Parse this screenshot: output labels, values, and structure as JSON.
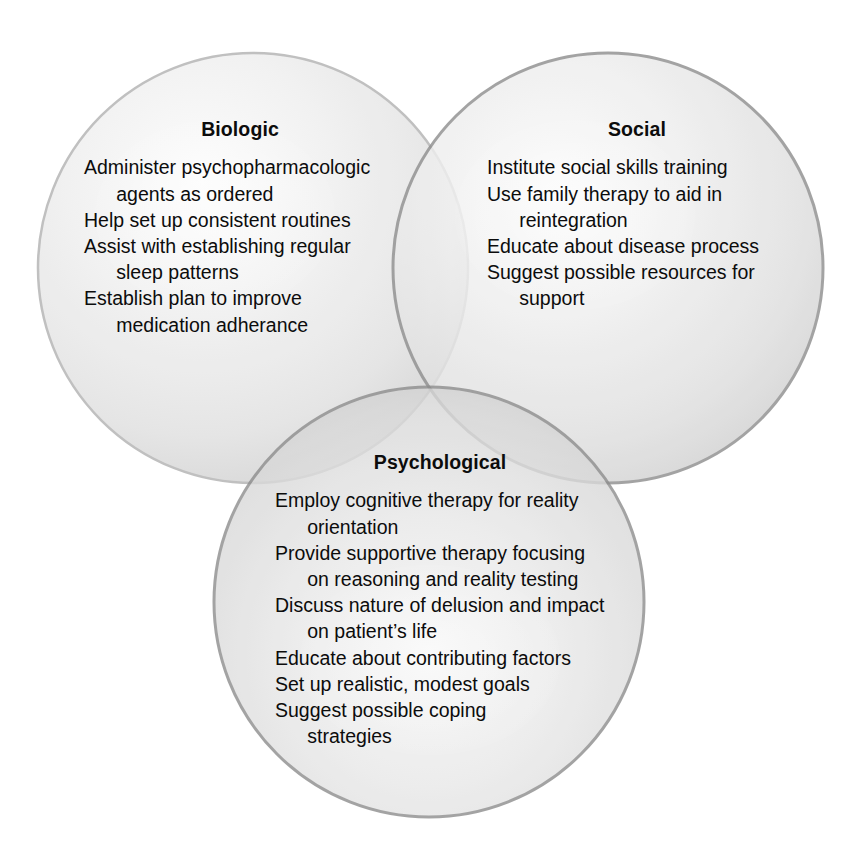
{
  "figure": {
    "type": "venn-diagram",
    "set_count": 3,
    "background_color": "#ffffff",
    "text_color": "#0c0c0c"
  },
  "groups": [
    {
      "id": "biologic",
      "title": "Biologic",
      "fill_color": "#e9e9e9",
      "stroke_color": "#b4b4b4",
      "items": [
        "Administer psychopharmacologic\n   agents as ordered",
        "Help set up consistent routines",
        "Assist with establishing regular\n   sleep patterns",
        "Establish plan to improve\n   medication adherance"
      ]
    },
    {
      "id": "social",
      "title": "Social",
      "fill_color": "#e3e3e3",
      "stroke_color": "#8d8d8d",
      "items": [
        "Institute social skills training",
        "Use family therapy to aid in\n   reintegration",
        "Educate about disease process",
        "Suggest possible resources for\n   support"
      ]
    },
    {
      "id": "psychological",
      "title": "Psychological",
      "fill_color": "#dcdcdc",
      "stroke_color": "#8a8a8a",
      "items": [
        "Employ cognitive therapy for reality\n   orientation",
        "Provide supportive therapy focusing\n   on reasoning and reality testing",
        "Discuss nature of delusion and impact\n   on patient’s life",
        "Educate about contributing factors",
        "Set up realistic, modest goals",
        "Suggest possible coping\n   strategies"
      ]
    }
  ]
}
